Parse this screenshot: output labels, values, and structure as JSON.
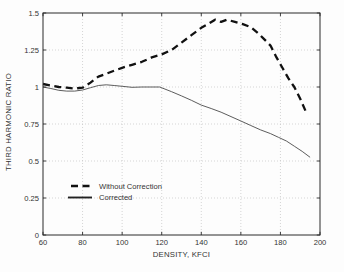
{
  "chart_data": {
    "type": "line",
    "title": "",
    "xlabel": "DENSITY, KFCI",
    "ylabel": "THIRD HARMONIC RATIO",
    "xlim": [
      60,
      200
    ],
    "ylim": [
      0,
      1.5
    ],
    "x_ticks": [
      60,
      80,
      100,
      120,
      140,
      160,
      180,
      200
    ],
    "x_tick_labels": [
      "60",
      "80",
      "100",
      "120",
      "140",
      "160",
      "180",
      "200"
    ],
    "y_ticks": [
      0,
      0.25,
      0.5,
      0.75,
      1,
      1.25,
      1.5
    ],
    "y_tick_labels": [
      "0",
      "0.25",
      "0.5",
      "0.75",
      "1",
      "1.25",
      "1.5"
    ],
    "grid": "dotted",
    "legend_position": "inside-lower-left",
    "colors": {
      "axis": "#2b2b2b",
      "grid": "#c4c4c4",
      "dashed_series": "#111111",
      "solid_series": "#4a4a4a"
    },
    "series": [
      {
        "name": "Without Correction",
        "style": "dashed",
        "color": "#111111",
        "width": 2.3,
        "points": [
          [
            60,
            1.02
          ],
          [
            64,
            1.01
          ],
          [
            68,
            1.0
          ],
          [
            72,
            0.995
          ],
          [
            76,
            0.99
          ],
          [
            80,
            0.995
          ],
          [
            84,
            1.03
          ],
          [
            88,
            1.07
          ],
          [
            92,
            1.09
          ],
          [
            96,
            1.11
          ],
          [
            100,
            1.13
          ],
          [
            105,
            1.15
          ],
          [
            110,
            1.17
          ],
          [
            115,
            1.2
          ],
          [
            120,
            1.22
          ],
          [
            125,
            1.25
          ],
          [
            130,
            1.3
          ],
          [
            135,
            1.35
          ],
          [
            140,
            1.4
          ],
          [
            144,
            1.43
          ],
          [
            147,
            1.455
          ],
          [
            150,
            1.44
          ],
          [
            153,
            1.455
          ],
          [
            157,
            1.44
          ],
          [
            161,
            1.425
          ],
          [
            165,
            1.405
          ],
          [
            169,
            1.36
          ],
          [
            172,
            1.32
          ],
          [
            175,
            1.28
          ],
          [
            178,
            1.2
          ],
          [
            181,
            1.13
          ],
          [
            184,
            1.06
          ],
          [
            187,
            1.0
          ],
          [
            190,
            0.92
          ],
          [
            193,
            0.83
          ]
        ]
      },
      {
        "name": "Corrected",
        "style": "solid",
        "color": "#4a4a4a",
        "width": 0.9,
        "points": [
          [
            60,
            1.0
          ],
          [
            64,
            0.99
          ],
          [
            68,
            0.978
          ],
          [
            72,
            0.972
          ],
          [
            76,
            0.972
          ],
          [
            80,
            0.98
          ],
          [
            84,
            0.995
          ],
          [
            88,
            1.01
          ],
          [
            92,
            1.015
          ],
          [
            96,
            1.01
          ],
          [
            100,
            1.005
          ],
          [
            105,
            0.998
          ],
          [
            110,
            1.0
          ],
          [
            115,
            1.0
          ],
          [
            119,
            1.0
          ],
          [
            125,
            0.968
          ],
          [
            130,
            0.94
          ],
          [
            135,
            0.91
          ],
          [
            140,
            0.878
          ],
          [
            145,
            0.855
          ],
          [
            150,
            0.83
          ],
          [
            155,
            0.8
          ],
          [
            160,
            0.77
          ],
          [
            165,
            0.74
          ],
          [
            170,
            0.71
          ],
          [
            175,
            0.685
          ],
          [
            179,
            0.66
          ],
          [
            183,
            0.635
          ],
          [
            187,
            0.6
          ],
          [
            191,
            0.565
          ],
          [
            195,
            0.525
          ]
        ]
      }
    ]
  }
}
